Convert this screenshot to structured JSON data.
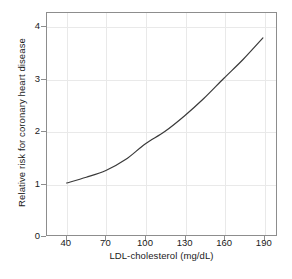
{
  "chart_data": {
    "type": "line",
    "title": "",
    "subtitle": "",
    "xlabel": "LDL-cholesterol (mg/dL)",
    "ylabel": "Relative risk for coronary heart disease",
    "xlim": [
      25,
      200
    ],
    "ylim": [
      0,
      4.27
    ],
    "xticks": [
      40,
      70,
      100,
      130,
      160,
      190
    ],
    "xtick_labels": [
      "40",
      "70",
      "100",
      "130",
      "160",
      "190"
    ],
    "yticks": [
      0,
      1,
      2,
      3,
      4
    ],
    "ytick_labels": [
      "0",
      "1",
      "2",
      "3",
      "4"
    ],
    "grid": true,
    "grid_color": "#e9e9e9",
    "legend": "none",
    "series": [
      {
        "name": "Relative risk",
        "color": "#3a3a3a",
        "x": [
          40,
          55,
          70,
          85,
          100,
          115,
          130,
          145,
          160,
          175,
          190
        ],
        "values": [
          1.0,
          1.11,
          1.24,
          1.45,
          1.75,
          1.99,
          2.29,
          2.63,
          3.01,
          3.38,
          3.79
        ]
      }
    ]
  },
  "axes": {
    "x_title": "LDL-cholesterol (mg/dL)",
    "y_title": "Relative risk for coronary heart disease"
  },
  "colors": {
    "curve": "#3a3a3a",
    "frame": "#8d8d8d",
    "grid": "#e9e9e9",
    "text": "#1a1a1a",
    "background": "#ffffff"
  }
}
